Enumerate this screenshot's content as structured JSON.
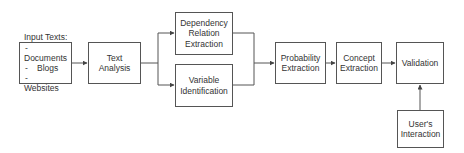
{
  "diagram": {
    "nodes": {
      "input": {
        "title": "Input Texts:",
        "items": [
          "Documents",
          "Blogs",
          "Websites"
        ]
      },
      "text_analysis": {
        "label": "Text Analysis"
      },
      "dependency": {
        "label": "Dependency Relation Extraction"
      },
      "variable": {
        "label": "Variable Identification"
      },
      "probability": {
        "label": "Probability Extraction"
      },
      "concept": {
        "label": "Concept Extraction"
      },
      "validation": {
        "label": "Validation"
      },
      "user_interaction": {
        "label": "User's Interaction"
      }
    },
    "edges": [
      {
        "from": "input",
        "to": "text_analysis"
      },
      {
        "from": "text_analysis",
        "to": "dependency"
      },
      {
        "from": "text_analysis",
        "to": "variable"
      },
      {
        "from": "dependency",
        "to": "probability"
      },
      {
        "from": "variable",
        "to": "probability"
      },
      {
        "from": "probability",
        "to": "concept"
      },
      {
        "from": "concept",
        "to": "validation"
      },
      {
        "from": "user_interaction",
        "to": "validation"
      }
    ],
    "colors": {
      "stroke": "#555555",
      "text": "#333333",
      "background": "#ffffff"
    }
  }
}
